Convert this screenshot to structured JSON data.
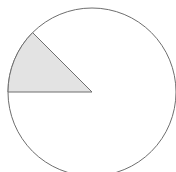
{
  "chart_data": {
    "type": "pie",
    "title": "",
    "categories": [
      "Shaded",
      "Unshaded"
    ],
    "values": [
      12.5,
      87.5
    ],
    "fractions": [
      "1/8",
      "7/8"
    ],
    "slice_angles_deg": {
      "Shaded": [
        135,
        180
      ],
      "Unshaded": [
        180,
        495
      ]
    },
    "colors": {
      "Shaded": "#e3e3e3",
      "Unshaded": "#ffffff",
      "stroke": "#6e6e6e"
    },
    "legend": "none",
    "labels": "none"
  },
  "geometry": {
    "cx": 92,
    "cy": 92,
    "r": 84
  }
}
